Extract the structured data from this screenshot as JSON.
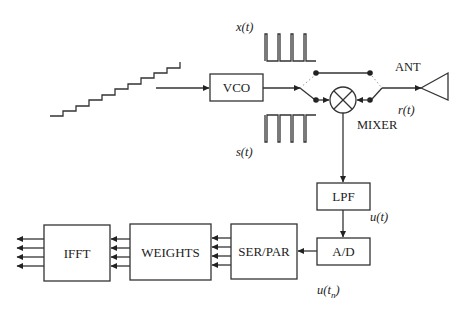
{
  "diagram": {
    "type": "block-diagram",
    "blocks": {
      "vco": "VCO",
      "lpf": "LPF",
      "adc": "A/D",
      "serpar": "SER/PAR",
      "weights": "WEIGHTS",
      "ifft": "IFFT"
    },
    "labels": {
      "x_signal": "x(t)",
      "s_signal": "s(t)",
      "antenna": "ANT",
      "received": "r(t)",
      "mixer": "MIXER",
      "u_signal": "u(t)",
      "u_sampled_prefix": "u(t",
      "u_sampled_sub": "n",
      "u_sampled_suffix": ")"
    },
    "mixer_symbol": "⊗",
    "parallel_lines": 4,
    "staircase_steps": 10,
    "colors": {
      "line": "#333333",
      "background": "#ffffff"
    }
  }
}
